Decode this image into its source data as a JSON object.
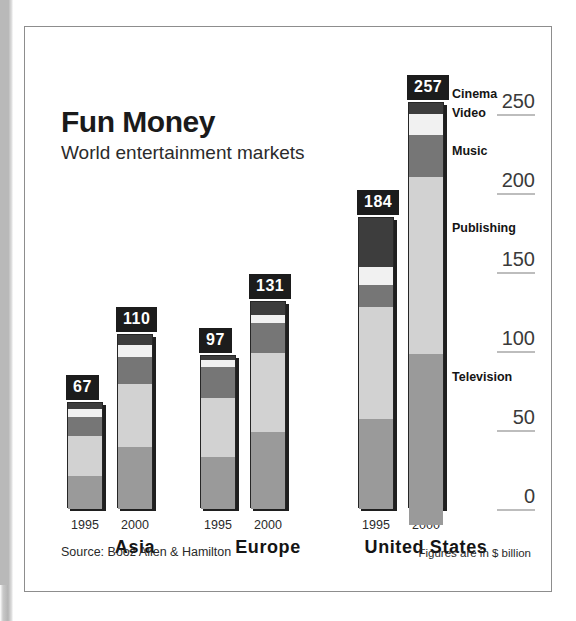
{
  "figure": {
    "title": "Fun Money",
    "subtitle": "World entertainment markets",
    "source_note": "Source: Booz Allen & Hamilton",
    "units_note": "Figures are in $ billion"
  },
  "axis": {
    "ticks": [
      {
        "label": "250",
        "value": 250
      },
      {
        "label": "200",
        "value": 200
      },
      {
        "label": "150",
        "value": 150
      },
      {
        "label": "100",
        "value": 100
      },
      {
        "label": "50",
        "value": 50
      },
      {
        "label": "0",
        "value": 0
      }
    ]
  },
  "callouts": {
    "cinema": "Cinema",
    "video": "Video",
    "music": "Music",
    "publishing": "Publishing",
    "television": "Television"
  },
  "groups": [
    {
      "region": "Asia",
      "bars": [
        {
          "year": "1995",
          "total": "67"
        },
        {
          "year": "2000",
          "total": "110"
        }
      ]
    },
    {
      "region": "Europe",
      "bars": [
        {
          "year": "1995",
          "total": "97"
        },
        {
          "year": "2000",
          "total": "131"
        }
      ]
    },
    {
      "region": "United States",
      "bars": [
        {
          "year": "1995",
          "total": "184"
        },
        {
          "year": "2000",
          "total": "257"
        }
      ]
    }
  ],
  "chart_data": {
    "type": "bar",
    "subtype": "stacked-vertical-grouped",
    "title": "Fun Money",
    "subtitle": "World entertainment markets",
    "xlabel": "",
    "ylabel": "$ billion",
    "ylim": [
      0,
      270
    ],
    "yticks": [
      0,
      50,
      100,
      150,
      200,
      250
    ],
    "grid": false,
    "legend_position": "inline-callouts-right-of-bars",
    "series_order_bottom_to_top": [
      "Television",
      "Publishing",
      "Music",
      "Video",
      "Cinema"
    ],
    "series_colors": {
      "Television": "#9a9a9a",
      "Publishing": "#d2d2d2",
      "Music": "#767676",
      "Video": "#f1f1f1",
      "Cinema": "#3d3d3d"
    },
    "categories": [
      "Asia 1995",
      "Asia 2000",
      "Europe 1995",
      "Europe 2000",
      "United States 1995",
      "United States 2000"
    ],
    "totals": [
      67,
      110,
      97,
      131,
      184,
      257
    ],
    "series": [
      {
        "name": "Television",
        "values": [
          21,
          39,
          33,
          49,
          57,
          108
        ]
      },
      {
        "name": "Publishing",
        "values": [
          25,
          40,
          37,
          50,
          71,
          112
        ]
      },
      {
        "name": "Music",
        "values": [
          12,
          17,
          20,
          19,
          14,
          27
        ]
      },
      {
        "name": "Video",
        "values": [
          5,
          8,
          4,
          5,
          11,
          13
        ]
      },
      {
        "name": "Cinema",
        "values": [
          4,
          6,
          3,
          8,
          31,
          7
        ]
      }
    ],
    "source": "Booz Allen & Hamilton",
    "units": "$ billion"
  }
}
